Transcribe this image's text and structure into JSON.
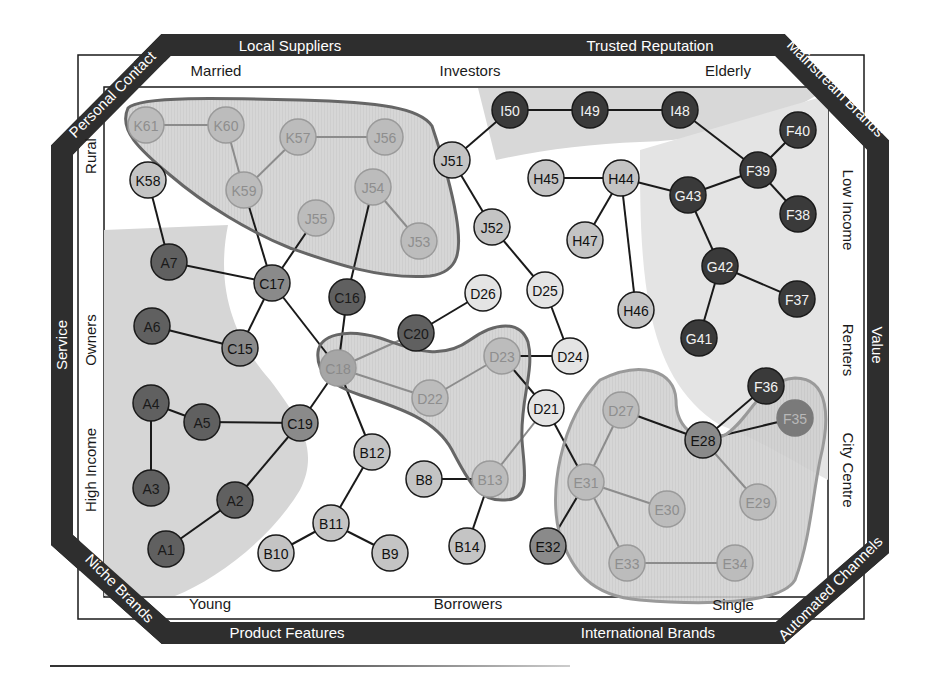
{
  "diagram": {
    "colors": {
      "band": "#2e2e2e",
      "frame_line": "#1a1a1a",
      "region_gray": "#d9d9d9",
      "region_light": "#e9e9e9",
      "white": "#ffffff",
      "blob_dark_outline": "#666666",
      "blob_light_outline": "#9a9a9a",
      "blob_fill": "#cfcfcf",
      "edge_dark": "#1a1a1a",
      "edge_faded": "#8c8c8c"
    },
    "outer_band_labels": {
      "top_left": "Local Suppliers",
      "top_right": "Trusted Reputation",
      "corner_top_left": "Personal Contact",
      "corner_top_right": "Mainstream Brands",
      "left": "Service",
      "right": "Value",
      "corner_bottom_left": "Niche Brands",
      "corner_bottom_right": "Automated Channels",
      "bottom_left": "Product Features",
      "bottom_right": "International Brands"
    },
    "inner_axis_labels": {
      "top": [
        "Married",
        "Investors",
        "Elderly"
      ],
      "bottom": [
        "Young",
        "Borrowers",
        "Single"
      ],
      "left": [
        "Rural",
        "Owners",
        "High Income"
      ],
      "right": [
        "Low Income",
        "Renters",
        "City Centre"
      ]
    },
    "node_styles": {
      "dark": {
        "fill": "#3a3a3a",
        "stroke": "#1a1a1a",
        "text": "#f2f2f2"
      },
      "darkmid": {
        "fill": "#606060",
        "stroke": "#1a1a1a",
        "text": "#1a1a1a"
      },
      "mid": {
        "fill": "#8a8a8a",
        "stroke": "#1a1a1a",
        "text": "#111111"
      },
      "light": {
        "fill": "#c4c4c4",
        "stroke": "#1a1a1a",
        "text": "#111111"
      },
      "pale": {
        "fill": "#e4e4e4",
        "stroke": "#1a1a1a",
        "text": "#111111"
      },
      "ghost": {
        "fill": "#bcbcbc",
        "stroke": "#9a9a9a",
        "text": "#8e8e8e"
      },
      "ghostmid": {
        "fill": "#a6a6a6",
        "stroke": "#9a9a9a",
        "text": "#8a8a8a"
      },
      "ghostdark": {
        "fill": "#7a7a7a",
        "stroke": "#7a7a7a",
        "text": "#b8b8b8"
      }
    },
    "nodes": [
      {
        "id": "A1",
        "x": 166,
        "y": 549,
        "style": "darkmid"
      },
      {
        "id": "A2",
        "x": 235,
        "y": 500,
        "style": "darkmid"
      },
      {
        "id": "A3",
        "x": 151,
        "y": 488,
        "style": "darkmid"
      },
      {
        "id": "A4",
        "x": 151,
        "y": 403,
        "style": "darkmid"
      },
      {
        "id": "A5",
        "x": 202,
        "y": 422,
        "style": "darkmid"
      },
      {
        "id": "A6",
        "x": 152,
        "y": 326,
        "style": "darkmid"
      },
      {
        "id": "A7",
        "x": 169,
        "y": 262,
        "style": "darkmid"
      },
      {
        "id": "B8",
        "x": 424,
        "y": 479,
        "style": "light"
      },
      {
        "id": "B9",
        "x": 390,
        "y": 553,
        "style": "light"
      },
      {
        "id": "B10",
        "x": 276,
        "y": 553,
        "style": "light"
      },
      {
        "id": "B11",
        "x": 331,
        "y": 523,
        "style": "light"
      },
      {
        "id": "B12",
        "x": 372,
        "y": 452,
        "style": "light"
      },
      {
        "id": "B13",
        "x": 490,
        "y": 479,
        "style": "ghost"
      },
      {
        "id": "B14",
        "x": 467,
        "y": 546,
        "style": "light"
      },
      {
        "id": "C15",
        "x": 240,
        "y": 348,
        "style": "mid"
      },
      {
        "id": "C16",
        "x": 347,
        "y": 297,
        "style": "darkmid"
      },
      {
        "id": "C17",
        "x": 272,
        "y": 283,
        "style": "mid"
      },
      {
        "id": "C18",
        "x": 338,
        "y": 368,
        "style": "ghostmid"
      },
      {
        "id": "C19",
        "x": 300,
        "y": 423,
        "style": "mid"
      },
      {
        "id": "C20",
        "x": 416,
        "y": 333,
        "style": "darkmid"
      },
      {
        "id": "D21",
        "x": 546,
        "y": 408,
        "style": "pale"
      },
      {
        "id": "D22",
        "x": 430,
        "y": 398,
        "style": "ghost"
      },
      {
        "id": "D23",
        "x": 502,
        "y": 356,
        "style": "ghost"
      },
      {
        "id": "D24",
        "x": 570,
        "y": 356,
        "style": "pale"
      },
      {
        "id": "D25",
        "x": 545,
        "y": 290,
        "style": "pale"
      },
      {
        "id": "D26",
        "x": 483,
        "y": 293,
        "style": "pale"
      },
      {
        "id": "D27",
        "x": 621,
        "y": 410,
        "style": "ghost"
      },
      {
        "id": "E28",
        "x": 703,
        "y": 440,
        "style": "mid"
      },
      {
        "id": "E29",
        "x": 758,
        "y": 502,
        "style": "ghost"
      },
      {
        "id": "E30",
        "x": 667,
        "y": 509,
        "style": "ghost"
      },
      {
        "id": "E31",
        "x": 586,
        "y": 482,
        "style": "ghost"
      },
      {
        "id": "E32",
        "x": 548,
        "y": 546,
        "style": "mid"
      },
      {
        "id": "E33",
        "x": 627,
        "y": 563,
        "style": "ghost"
      },
      {
        "id": "E34",
        "x": 735,
        "y": 563,
        "style": "ghost"
      },
      {
        "id": "F35",
        "x": 795,
        "y": 418,
        "style": "ghostdark"
      },
      {
        "id": "F36",
        "x": 766,
        "y": 386,
        "style": "dark"
      },
      {
        "id": "F37",
        "x": 797,
        "y": 299,
        "style": "dark"
      },
      {
        "id": "F38",
        "x": 798,
        "y": 214,
        "style": "dark"
      },
      {
        "id": "F39",
        "x": 758,
        "y": 170,
        "style": "dark"
      },
      {
        "id": "F40",
        "x": 798,
        "y": 130,
        "style": "dark"
      },
      {
        "id": "G41",
        "x": 699,
        "y": 338,
        "style": "dark"
      },
      {
        "id": "G42",
        "x": 720,
        "y": 266,
        "style": "dark"
      },
      {
        "id": "G43",
        "x": 688,
        "y": 195,
        "style": "dark"
      },
      {
        "id": "H44",
        "x": 621,
        "y": 178,
        "style": "light"
      },
      {
        "id": "H45",
        "x": 546,
        "y": 178,
        "style": "light"
      },
      {
        "id": "H46",
        "x": 636,
        "y": 310,
        "style": "light"
      },
      {
        "id": "H47",
        "x": 585,
        "y": 240,
        "style": "light"
      },
      {
        "id": "I48",
        "x": 680,
        "y": 110,
        "style": "dark"
      },
      {
        "id": "I49",
        "x": 590,
        "y": 110,
        "style": "dark"
      },
      {
        "id": "I50",
        "x": 510,
        "y": 110,
        "style": "dark"
      },
      {
        "id": "J51",
        "x": 452,
        "y": 160,
        "style": "light"
      },
      {
        "id": "J52",
        "x": 492,
        "y": 227,
        "style": "light"
      },
      {
        "id": "J53",
        "x": 419,
        "y": 241,
        "style": "ghost"
      },
      {
        "id": "J54",
        "x": 373,
        "y": 187,
        "style": "ghost"
      },
      {
        "id": "J55",
        "x": 316,
        "y": 218,
        "style": "ghost"
      },
      {
        "id": "J56",
        "x": 385,
        "y": 137,
        "style": "ghost"
      },
      {
        "id": "K57",
        "x": 298,
        "y": 137,
        "style": "ghost"
      },
      {
        "id": "K58",
        "x": 148,
        "y": 180,
        "style": "light"
      },
      {
        "id": "K59",
        "x": 244,
        "y": 190,
        "style": "ghost"
      },
      {
        "id": "K60",
        "x": 226,
        "y": 125,
        "style": "ghost"
      },
      {
        "id": "K61",
        "x": 146,
        "y": 125,
        "style": "ghost"
      }
    ],
    "edges": [
      [
        "K61",
        "K60",
        "faded"
      ],
      [
        "K60",
        "K59",
        "faded"
      ],
      [
        "K57",
        "K59",
        "faded"
      ],
      [
        "K57",
        "J56",
        "faded"
      ],
      [
        "J54",
        "J53",
        "faded"
      ],
      [
        "K58",
        "A7",
        "dark"
      ],
      [
        "K59",
        "C17",
        "dark"
      ],
      [
        "J55",
        "C17",
        "dark"
      ],
      [
        "J54",
        "C16",
        "dark"
      ],
      [
        "A7",
        "C17",
        "dark"
      ],
      [
        "C17",
        "C15",
        "dark"
      ],
      [
        "C17",
        "C18",
        "dark"
      ],
      [
        "A6",
        "C15",
        "dark"
      ],
      [
        "C16",
        "C18",
        "dark"
      ],
      [
        "C20",
        "C18",
        "faded"
      ],
      [
        "C20",
        "D26",
        "dark"
      ],
      [
        "C18",
        "D22",
        "faded"
      ],
      [
        "D22",
        "D23",
        "faded"
      ],
      [
        "D23",
        "D24",
        "dark"
      ],
      [
        "D23",
        "D21",
        "dark"
      ],
      [
        "D25",
        "D24",
        "dark"
      ],
      [
        "J52",
        "D25",
        "dark"
      ],
      [
        "J51",
        "J52",
        "dark"
      ],
      [
        "J51",
        "I50",
        "dark"
      ],
      [
        "I50",
        "I49",
        "dark"
      ],
      [
        "I49",
        "I48",
        "dark"
      ],
      [
        "I48",
        "F39",
        "dark"
      ],
      [
        "F39",
        "F40",
        "dark"
      ],
      [
        "F39",
        "F38",
        "dark"
      ],
      [
        "F39",
        "G43",
        "dark"
      ],
      [
        "H44",
        "G43",
        "dark"
      ],
      [
        "H45",
        "H44",
        "dark"
      ],
      [
        "H44",
        "H47",
        "dark"
      ],
      [
        "H44",
        "H46",
        "dark"
      ],
      [
        "G43",
        "G42",
        "dark"
      ],
      [
        "G42",
        "F37",
        "dark"
      ],
      [
        "G42",
        "G41",
        "dark"
      ],
      [
        "F36",
        "E28",
        "dark"
      ],
      [
        "E28",
        "F35",
        "dark"
      ],
      [
        "D27",
        "E28",
        "dark"
      ],
      [
        "E28",
        "E29",
        "faded"
      ],
      [
        "D27",
        "E31",
        "faded"
      ],
      [
        "E31",
        "E30",
        "faded"
      ],
      [
        "E31",
        "E33",
        "faded"
      ],
      [
        "E33",
        "E34",
        "faded"
      ],
      [
        "E31",
        "E32",
        "dark"
      ],
      [
        "D21",
        "E31",
        "dark"
      ],
      [
        "D21",
        "B13",
        "faded"
      ],
      [
        "B8",
        "B13",
        "dark"
      ],
      [
        "B13",
        "B14",
        "dark"
      ],
      [
        "C18",
        "C19",
        "dark"
      ],
      [
        "C18",
        "B12",
        "dark"
      ],
      [
        "B12",
        "B11",
        "dark"
      ],
      [
        "B11",
        "B10",
        "dark"
      ],
      [
        "B11",
        "B9",
        "dark"
      ],
      [
        "A4",
        "A5",
        "dark"
      ],
      [
        "A4",
        "A3",
        "dark"
      ],
      [
        "A5",
        "C19",
        "dark"
      ],
      [
        "C19",
        "A2",
        "dark"
      ],
      [
        "A2",
        "A1",
        "dark"
      ]
    ],
    "clusters": [
      {
        "name": "K-J cluster",
        "outline": "dark",
        "path": "M128,108 C140,96 220,98 300,100 C380,102 420,108 432,126 C440,150 450,180 456,215 C462,250 460,272 430,276 C380,280 330,262 290,248 C250,232 205,205 170,175 C140,150 118,130 128,108 Z"
      },
      {
        "name": "C18-D23-B13 cluster",
        "outline": "dark",
        "path": "M318,352 C320,335 345,328 380,338 C410,348 440,362 470,340 C495,322 520,320 528,342 C535,370 520,400 522,440 C524,470 532,500 505,500 C478,502 468,480 452,450 C436,420 400,408 360,395 C330,385 316,372 318,352 Z"
      },
      {
        "name": "E cluster",
        "outline": "light",
        "path": "M600,380 C640,360 675,370 676,400 C676,430 700,445 725,435 C750,420 760,380 795,378 C830,378 830,420 820,460 C812,500 810,540 795,580 C780,605 700,605 640,600 C590,596 572,570 560,535 C548,495 560,420 600,380 Z"
      }
    ],
    "regions": [
      {
        "name": "left-gray",
        "fill": "#d6d6d6",
        "path": "M104,230 L228,225 C215,290 235,340 270,380 C300,420 320,450 300,490 C270,540 215,580 175,596 L104,596 Z"
      },
      {
        "name": "top-right-gray",
        "fill": "#d8d8d8",
        "path": "M478,88 L828,88 C780,120 720,140 640,142 C590,144 540,150 496,160 Z"
      },
      {
        "name": "right-light",
        "fill": "#e4e4e4",
        "path": "M640,150 L828,95 L828,480 C790,460 760,440 720,425 C680,400 660,360 650,310 C640,260 640,200 640,150 Z"
      }
    ]
  }
}
